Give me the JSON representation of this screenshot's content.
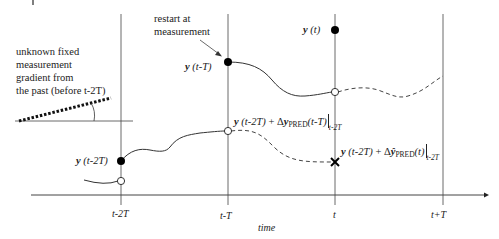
{
  "diagram": {
    "title": "",
    "annotations": {
      "restart": [
        "restart at",
        "measurement"
      ],
      "gradient": [
        "unknown fixed",
        "measurement",
        "gradient from",
        "the past  (before t-2T)"
      ]
    },
    "points": {
      "y_t": {
        "var": "y",
        "arg": "(t)"
      },
      "y_tT": {
        "var": "y",
        "arg": "(t-T)"
      },
      "y_t2T": {
        "var": "y",
        "arg": "(t-2T)"
      }
    },
    "predictions": {
      "pred1": {
        "base_var": "y",
        "base_arg": "(t-2T)",
        "plus": " + Δ",
        "delta_var": "y",
        "sub": "PRED",
        "arg": "(t-T)",
        "eval": "t-2T"
      },
      "pred2": {
        "base_var": "y",
        "base_arg": "(t-2T)",
        "plus": " + Δ",
        "delta_var": "ŷ",
        "sub": "PRED",
        "arg": "(t)",
        "eval": "t-2T"
      }
    },
    "axis": {
      "xlabel": "time",
      "ticks": [
        "t-2T",
        "t-T",
        "t",
        "t+T"
      ]
    }
  }
}
